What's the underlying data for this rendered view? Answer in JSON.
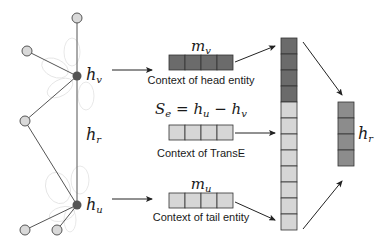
{
  "graph": {
    "nodes": {
      "h_v": {
        "label": "h",
        "sub": "v",
        "x": 77,
        "y": 76,
        "fill": "#555555"
      },
      "h_u": {
        "label": "h",
        "sub": "u",
        "x": 77,
        "y": 205,
        "fill": "#555555"
      },
      "neighbors": [
        {
          "x": 77,
          "y": 18
        },
        {
          "x": 27,
          "y": 51
        },
        {
          "x": 25,
          "y": 121
        },
        {
          "x": 25,
          "y": 230
        },
        {
          "x": 57,
          "y": 230
        }
      ],
      "neighbor_fill": "#d9d9d9"
    },
    "relation_label": {
      "label": "h",
      "sub": "r"
    }
  },
  "blocks": {
    "head": {
      "math_label": "m",
      "math_sub": "v",
      "caption": "Context of head entity",
      "cells": 4,
      "fill": "#6b6b6b"
    },
    "transe": {
      "math_label_parts": [
        "S",
        "e",
        " = h",
        "u",
        " − h",
        "v"
      ],
      "caption": "Context of TransE",
      "cells": 4,
      "fill": "#d6d6d6"
    },
    "tail": {
      "math_label": "m",
      "math_sub": "u",
      "caption": "Context of tail entity",
      "cells": 4,
      "fill": "#d6d6d6"
    }
  },
  "concat_stack": {
    "dark_cells": 4,
    "light_cells": 8,
    "dark_fill": "#6b6b6b",
    "light_fill": "#d6d6d6"
  },
  "output": {
    "label": "h",
    "sub": "r",
    "cells": 4,
    "fill": "#8c8c8c"
  },
  "colors": {
    "stroke": "#333333",
    "edge": "#555555",
    "faint": "#e4e4e4"
  }
}
